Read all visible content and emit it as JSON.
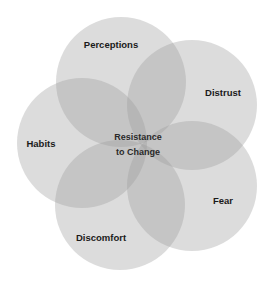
{
  "diagram": {
    "type": "venn-flower",
    "center_label": [
      "Resistance",
      "to Change"
    ],
    "petals": [
      {
        "label": "Perceptions",
        "cx": 121,
        "cy": 82,
        "r": 65,
        "lx": 111,
        "ly": 48
      },
      {
        "label": "Distrust",
        "cx": 192,
        "cy": 105,
        "r": 65,
        "lx": 223,
        "ly": 96
      },
      {
        "label": "Fear",
        "cx": 192,
        "cy": 186,
        "r": 65,
        "lx": 223,
        "ly": 204
      },
      {
        "label": "Discomfort",
        "cx": 120,
        "cy": 205,
        "r": 65,
        "lx": 101,
        "ly": 241
      },
      {
        "label": "Habits",
        "cx": 82,
        "cy": 143,
        "r": 65,
        "lx": 41,
        "ly": 147
      }
    ],
    "colors": {
      "fill": "#9a9a9a",
      "fill_opacity": 0.35,
      "text": "#1a1a1a"
    }
  }
}
